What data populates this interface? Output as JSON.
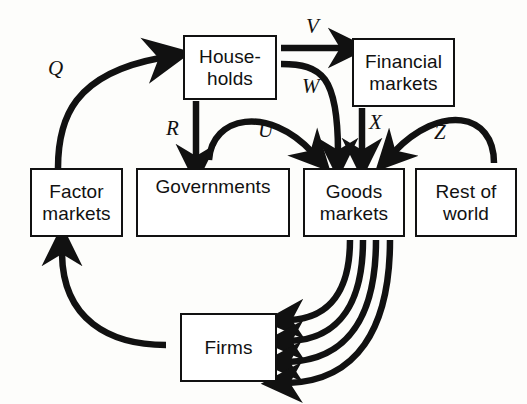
{
  "diagram": {
    "type": "economic-circular-flow",
    "stroke_color": "#111111",
    "background_color": "#fdfdfb",
    "nodes": [
      {
        "id": "households",
        "label": "House-\nholds",
        "x": 183,
        "y": 35,
        "w": 94,
        "h": 65,
        "text_align": "center"
      },
      {
        "id": "financial-markets",
        "label": "Financial\nmarkets",
        "x": 352,
        "y": 38,
        "w": 103,
        "h": 69,
        "text_align": "center"
      },
      {
        "id": "factor-markets",
        "label": "Factor\nmarkets",
        "x": 30,
        "y": 168,
        "w": 93,
        "h": 69,
        "text_align": "center"
      },
      {
        "id": "governments",
        "label": "Governments",
        "x": 136,
        "y": 168,
        "w": 154,
        "h": 69,
        "text_align": "top"
      },
      {
        "id": "goods-markets",
        "label": "Goods\nmarkets",
        "x": 303,
        "y": 168,
        "w": 102,
        "h": 69,
        "text_align": "center"
      },
      {
        "id": "rest-of-world",
        "label": "Rest of\nworld",
        "x": 415,
        "y": 168,
        "w": 102,
        "h": 69,
        "text_align": "center"
      },
      {
        "id": "firms",
        "label": "Firms",
        "x": 180,
        "y": 313,
        "w": 97,
        "h": 69,
        "text_align": "center"
      }
    ],
    "edge_labels": [
      {
        "id": "Q",
        "text": "Q",
        "x": 48,
        "y": 56,
        "from": "factor-markets",
        "to": "households"
      },
      {
        "id": "R",
        "text": "R",
        "x": 166,
        "y": 116,
        "from": "households",
        "to": "governments"
      },
      {
        "id": "U",
        "text": "U",
        "x": 258,
        "y": 118,
        "from": "households",
        "to": "goods-markets"
      },
      {
        "id": "V",
        "text": "V",
        "x": 306,
        "y": 14,
        "from": "households",
        "to": "financial-markets"
      },
      {
        "id": "W",
        "text": "W",
        "x": 302,
        "y": 74,
        "from": "households",
        "to": "goods-markets"
      },
      {
        "id": "X",
        "text": "X",
        "x": 369,
        "y": 110,
        "from": "financial-markets",
        "to": "goods-markets"
      },
      {
        "id": "Z",
        "text": "Z",
        "x": 434,
        "y": 120,
        "from": "rest-of-world",
        "to": "goods-markets"
      }
    ],
    "unlabeled_edges": [
      {
        "id": "firms-to-factor-markets",
        "from": "firms",
        "to": "factor-markets"
      },
      {
        "id": "goods-to-firms-1",
        "from": "goods-markets",
        "to": "firms"
      },
      {
        "id": "goods-to-firms-2",
        "from": "goods-markets",
        "to": "firms"
      },
      {
        "id": "goods-to-firms-3",
        "from": "goods-markets",
        "to": "firms"
      },
      {
        "id": "goods-to-firms-4",
        "from": "goods-markets",
        "to": "firms"
      }
    ]
  }
}
